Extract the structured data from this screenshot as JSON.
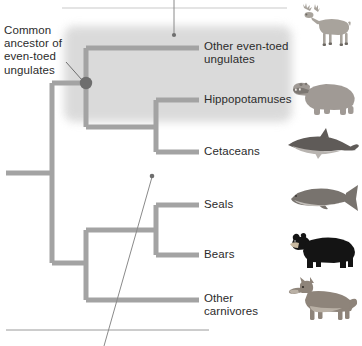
{
  "figure": {
    "type": "phylogenetic-tree",
    "annotation_label": "Common ancestor of even-toed ungulates"
  },
  "tips": [
    {
      "id": "other-even-toed-ungulates",
      "label": "Other even-toed\nungulates",
      "animal": "deer-illustration",
      "y": 48,
      "clade": "even-toed-ungulates"
    },
    {
      "id": "hippopotamuses",
      "label": "Hippopotamuses",
      "animal": "hippopotamus-illustration",
      "y": 100,
      "clade": "even-toed-ungulates"
    },
    {
      "id": "cetaceans",
      "label": "Cetaceans",
      "animal": "dolphin-illustration",
      "y": 152,
      "clade": "even-toed-ungulates"
    },
    {
      "id": "seals",
      "label": "Seals",
      "animal": "seal-illustration",
      "y": 205,
      "clade": "carnivores"
    },
    {
      "id": "bears",
      "label": "Bears",
      "animal": "bear-illustration",
      "y": 255,
      "clade": "carnivores"
    },
    {
      "id": "other-carnivores",
      "label": "Other\ncarnivores",
      "animal": "wolf-illustration",
      "y": 300,
      "clade": "carnivores"
    }
  ],
  "nodes": [
    {
      "id": "root-node",
      "x": 52,
      "y": 173,
      "marked": false
    },
    {
      "id": "even-toed-ancestor",
      "x": 86,
      "y": 83,
      "marked": true
    },
    {
      "id": "hippo-cetacean-ancestor",
      "x": 156,
      "y": 127,
      "marked": false
    },
    {
      "id": "carnivore-ancestor",
      "x": 86,
      "y": 263,
      "marked": false
    },
    {
      "id": "seal-bear-ancestor",
      "x": 156,
      "y": 230,
      "marked": false
    }
  ],
  "leaders": [
    {
      "id": "top-callout-leader",
      "dot_x": 174,
      "dot_y": 35,
      "line_to_x": 174,
      "line_to_y": 0
    },
    {
      "id": "bottom-callout-leader",
      "dot_x": 152,
      "dot_y": 176,
      "line_to_x": 104,
      "line_to_y": 346
    }
  ],
  "callout_boxes": [
    {
      "id": "top-callout-box",
      "edge": "bottom",
      "x": 62,
      "y": 8,
      "width": 225
    },
    {
      "id": "bottom-callout-box",
      "edge": "top",
      "x": 6,
      "y": 330,
      "width": 203
    }
  ],
  "colors": {
    "branch": "#a3a3a3",
    "node_marked": "#6e6e6e",
    "clade_shade": "#d9d9d9",
    "text": "#2b2b2b",
    "leader_line": "#8a8a8a",
    "callout_border": "#b5b5b5"
  }
}
